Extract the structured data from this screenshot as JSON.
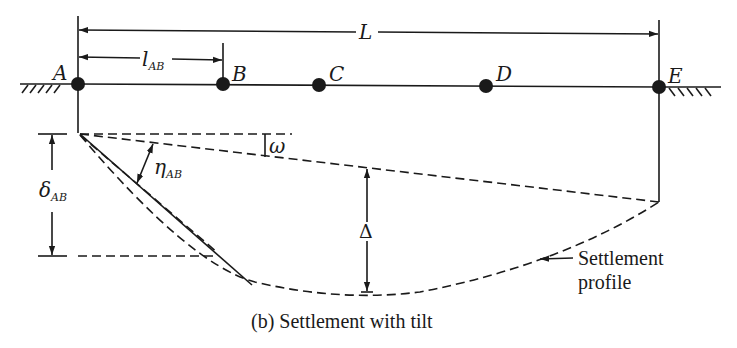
{
  "diagram": {
    "caption": "(b) Settlement with tilt",
    "colors": {
      "ink": "#1a1a1a",
      "background": "#ffffff"
    },
    "dimensions": {
      "total_length": {
        "symbol": "L"
      },
      "span_ab": {
        "symbol": "l",
        "subscript": "AB"
      }
    },
    "points": [
      {
        "id": "A",
        "label": "A"
      },
      {
        "id": "B",
        "label": "B"
      },
      {
        "id": "C",
        "label": "C"
      },
      {
        "id": "D",
        "label": "D"
      },
      {
        "id": "E",
        "label": "E"
      }
    ],
    "symbols": {
      "tilt": {
        "symbol": "ω"
      },
      "angular_distortion": {
        "symbol": "η",
        "subscript": "AB"
      },
      "differential_settlement": {
        "symbol": "δ",
        "subscript": "AB"
      },
      "relative_deflection": {
        "symbol": "Δ"
      }
    },
    "annotations": {
      "settlement_profile_line1": "Settlement",
      "settlement_profile_line2": "profile"
    }
  }
}
